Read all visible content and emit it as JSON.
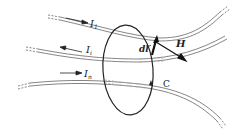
{
  "diagram": {
    "loop": {
      "label": "C"
    },
    "currents": [
      {
        "name": "I",
        "sub": "1",
        "direction": "right"
      },
      {
        "name": "I",
        "sub": "i",
        "direction": "left"
      },
      {
        "name": "I",
        "sub": "n",
        "direction": "right"
      }
    ],
    "element": {
      "label": "dl′"
    },
    "field": {
      "label": "H"
    },
    "colors": {
      "line": "#222222",
      "wire": "#555555"
    }
  }
}
